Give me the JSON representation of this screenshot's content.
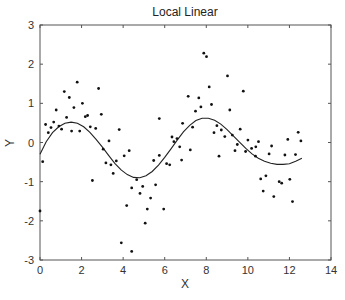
{
  "chart_data": {
    "type": "scatter",
    "title": "Local Linear",
    "xlabel": "X",
    "ylabel": "Y",
    "xlim": [
      0,
      14
    ],
    "ylim": [
      -3,
      3
    ],
    "xticks": [
      0,
      2,
      4,
      6,
      8,
      10,
      12,
      14
    ],
    "yticks": [
      -3,
      -2,
      -1,
      0,
      1,
      2,
      3
    ],
    "grid": false,
    "legend": null,
    "series": [
      {
        "name": "data",
        "type": "scatter",
        "marker": "dot",
        "color": "#111111",
        "points": [
          [
            0.27,
            0.46
          ],
          [
            0.4,
            0.25
          ],
          [
            0.53,
            0.38
          ],
          [
            0.66,
            0.52
          ],
          [
            0.78,
            0.83
          ],
          [
            0.91,
            0.42
          ],
          [
            1.04,
            0.34
          ],
          [
            1.17,
            1.3
          ],
          [
            1.28,
            0.64
          ],
          [
            1.41,
            1.15
          ],
          [
            1.52,
            0.29
          ],
          [
            1.63,
            0.89
          ],
          [
            1.79,
            1.54
          ],
          [
            1.91,
            0.29
          ],
          [
            2.04,
            1.0
          ],
          [
            2.18,
            0.66
          ],
          [
            2.29,
            0.69
          ],
          [
            2.42,
            0.4
          ],
          [
            2.68,
            0.36
          ],
          [
            2.82,
            1.38
          ],
          [
            2.95,
            0.72
          ],
          [
            3.32,
            0.04
          ],
          [
            3.81,
            0.33
          ],
          [
            5.74,
            0.61
          ],
          [
            6.35,
            0.14
          ],
          [
            6.44,
            0.02
          ],
          [
            6.59,
            0.1
          ],
          [
            6.72,
            -0.11
          ],
          [
            6.86,
            0.49
          ],
          [
            7.13,
            1.18
          ],
          [
            7.34,
            0.39
          ],
          [
            7.48,
            0.8
          ],
          [
            7.64,
            1.14
          ],
          [
            7.74,
            0.91
          ],
          [
            7.88,
            2.28
          ],
          [
            8.01,
            2.19
          ],
          [
            8.14,
            1.42
          ],
          [
            8.25,
            0.97
          ],
          [
            8.37,
            0.25
          ],
          [
            8.51,
            0.43
          ],
          [
            8.72,
            0.32
          ],
          [
            8.89,
            0.15
          ],
          [
            9.02,
            1.7
          ],
          [
            9.13,
            0.83
          ],
          [
            9.25,
            0.19
          ],
          [
            9.49,
            -0.05
          ],
          [
            9.63,
            0.34
          ],
          [
            9.78,
            1.31
          ],
          [
            10.0,
            0.06
          ],
          [
            10.38,
            -0.11
          ],
          [
            10.51,
            0.02
          ],
          [
            11.14,
            -0.09
          ],
          [
            11.92,
            0.08
          ],
          [
            12.42,
            0.26
          ],
          [
            12.55,
            0.04
          ],
          [
            0.0,
            -1.75
          ],
          [
            0.13,
            -0.49
          ],
          [
            2.52,
            -0.97
          ],
          [
            3.04,
            -0.17
          ],
          [
            3.17,
            -0.52
          ],
          [
            3.41,
            -0.57
          ],
          [
            3.52,
            -0.79
          ],
          [
            3.67,
            -0.47
          ],
          [
            4.05,
            -0.34
          ],
          [
            4.17,
            -1.61
          ],
          [
            4.29,
            -0.21
          ],
          [
            4.41,
            -1.16
          ],
          [
            4.65,
            -0.95
          ],
          [
            4.81,
            -1.3
          ],
          [
            4.94,
            -1.12
          ],
          [
            5.06,
            -2.06
          ],
          [
            5.16,
            -1.7
          ],
          [
            5.32,
            -1.42
          ],
          [
            5.47,
            -0.46
          ],
          [
            5.56,
            -1.08
          ],
          [
            5.95,
            -1.7
          ],
          [
            5.74,
            -0.33
          ],
          [
            6.09,
            -0.54
          ],
          [
            6.24,
            -0.57
          ],
          [
            6.81,
            -0.45
          ],
          [
            7.23,
            -0.19
          ],
          [
            8.61,
            -0.35
          ],
          [
            9.38,
            -0.21
          ],
          [
            9.89,
            -0.23
          ],
          [
            10.18,
            -0.15
          ],
          [
            10.37,
            -0.35
          ],
          [
            10.62,
            -0.93
          ],
          [
            10.74,
            -1.24
          ],
          [
            10.87,
            -0.85
          ],
          [
            11.02,
            -0.29
          ],
          [
            11.25,
            -1.38
          ],
          [
            11.51,
            -1.0
          ],
          [
            11.63,
            -1.04
          ],
          [
            11.78,
            -0.32
          ],
          [
            12.02,
            -0.94
          ],
          [
            12.15,
            -1.51
          ],
          [
            12.29,
            -0.31
          ],
          [
            3.91,
            -2.56
          ],
          [
            4.41,
            -2.78
          ]
        ]
      },
      {
        "name": "local linear fit",
        "type": "line",
        "color": "#222222",
        "points": [
          [
            0.0,
            -0.3
          ],
          [
            0.3,
            0.02
          ],
          [
            0.6,
            0.25
          ],
          [
            0.9,
            0.4
          ],
          [
            1.2,
            0.49
          ],
          [
            1.5,
            0.52
          ],
          [
            1.8,
            0.49
          ],
          [
            2.1,
            0.4
          ],
          [
            2.4,
            0.26
          ],
          [
            2.7,
            0.08
          ],
          [
            3.0,
            -0.12
          ],
          [
            3.3,
            -0.33
          ],
          [
            3.6,
            -0.53
          ],
          [
            3.9,
            -0.7
          ],
          [
            4.2,
            -0.82
          ],
          [
            4.5,
            -0.89
          ],
          [
            4.8,
            -0.9
          ],
          [
            5.1,
            -0.85
          ],
          [
            5.4,
            -0.74
          ],
          [
            5.7,
            -0.58
          ],
          [
            6.0,
            -0.38
          ],
          [
            6.3,
            -0.16
          ],
          [
            6.6,
            0.06
          ],
          [
            6.9,
            0.27
          ],
          [
            7.2,
            0.44
          ],
          [
            7.5,
            0.56
          ],
          [
            7.8,
            0.62
          ],
          [
            8.1,
            0.62
          ],
          [
            8.4,
            0.57
          ],
          [
            8.7,
            0.47
          ],
          [
            9.0,
            0.33
          ],
          [
            9.3,
            0.17
          ],
          [
            9.6,
            0.01
          ],
          [
            9.9,
            -0.15
          ],
          [
            10.2,
            -0.29
          ],
          [
            10.5,
            -0.4
          ],
          [
            10.8,
            -0.48
          ],
          [
            11.1,
            -0.53
          ],
          [
            11.4,
            -0.56
          ],
          [
            11.7,
            -0.56
          ],
          [
            12.0,
            -0.54
          ],
          [
            12.3,
            -0.48
          ],
          [
            12.6,
            -0.4
          ]
        ]
      }
    ]
  },
  "axes": {
    "title": "Local Linear",
    "xlabel": "X",
    "ylabel": "Y"
  }
}
